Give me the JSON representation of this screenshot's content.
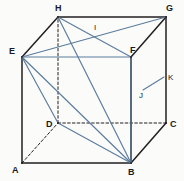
{
  "figure": {
    "kind": "cube-with-diagonals",
    "canvas": {
      "width": 184,
      "height": 181
    },
    "colors": {
      "edge_solid": "#231f20",
      "edge_hidden": "#231f20",
      "diagonal": "#5a7c9d",
      "background": "#fbfbfa",
      "label": "#1a1a1a"
    },
    "vertices": [
      {
        "id": "A",
        "label": "A",
        "x": 22,
        "y": 163,
        "label_x": 12,
        "label_y": 166,
        "hidden": false
      },
      {
        "id": "B",
        "label": "B",
        "x": 131,
        "y": 163,
        "label_x": 128,
        "label_y": 168,
        "hidden": false
      },
      {
        "id": "C",
        "label": "C",
        "x": 166,
        "y": 123,
        "label_x": 170,
        "label_y": 120,
        "hidden": false
      },
      {
        "id": "D",
        "label": "D",
        "x": 58,
        "y": 123,
        "label_x": 46,
        "label_y": 120,
        "hidden": true
      },
      {
        "id": "E",
        "label": "E",
        "x": 22,
        "y": 57,
        "label_x": 9,
        "label_y": 47,
        "hidden": false
      },
      {
        "id": "F",
        "label": "F",
        "x": 131,
        "y": 57,
        "label_x": 130,
        "label_y": 46,
        "hidden": false
      },
      {
        "id": "G",
        "label": "G",
        "x": 166,
        "y": 17,
        "label_x": 166,
        "label_y": 4,
        "hidden": false
      },
      {
        "id": "H",
        "label": "H",
        "x": 58,
        "y": 17,
        "label_x": 55,
        "label_y": 4,
        "hidden": false
      }
    ],
    "points": [
      {
        "id": "I",
        "label": "I",
        "x": 96,
        "y": 33,
        "label_x": 94,
        "label_y": 24,
        "note": "intersection of EG and HF"
      },
      {
        "id": "J",
        "label": "J",
        "x": 143,
        "y": 90,
        "label_x": 139,
        "label_y": 92,
        "note": "point on FB segment"
      },
      {
        "id": "K",
        "label": "K",
        "x": 164,
        "y": 77,
        "label_x": 168,
        "label_y": 74,
        "note": "tick endpoint from J"
      }
    ],
    "edges_solid": [
      {
        "from": "A",
        "to": "B"
      },
      {
        "from": "B",
        "to": "C"
      },
      {
        "from": "B",
        "to": "F"
      },
      {
        "from": "C",
        "to": "G"
      },
      {
        "from": "A",
        "to": "E"
      },
      {
        "from": "E",
        "to": "H"
      },
      {
        "from": "H",
        "to": "G"
      },
      {
        "from": "F",
        "to": "G"
      }
    ],
    "edges_hidden": [
      {
        "from": "A",
        "to": "D"
      },
      {
        "from": "D",
        "to": "C"
      },
      {
        "from": "D",
        "to": "H"
      }
    ],
    "edges_diagonal": [
      {
        "from": "E",
        "to": "F",
        "note": "front-top edge drawn in blue"
      },
      {
        "from": "E",
        "to": "G",
        "note": "top-face diagonal"
      },
      {
        "from": "H",
        "to": "F",
        "note": "top-face diagonal"
      },
      {
        "from": "H",
        "to": "B",
        "note": "space diagonal"
      },
      {
        "from": "E",
        "to": "B",
        "note": "face diagonal"
      },
      {
        "from": "E",
        "to": "D",
        "note": "face diagonal"
      },
      {
        "from": "D",
        "to": "B",
        "note": "bottom-face diagonal"
      },
      {
        "from": "F",
        "to": "B",
        "note": "right-face line through J"
      },
      {
        "from": "J",
        "to": "K",
        "note": "short tick from J to K"
      }
    ]
  }
}
